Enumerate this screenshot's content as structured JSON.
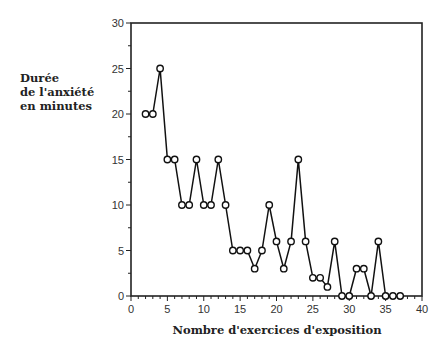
{
  "chart_data": {
    "type": "line",
    "title": "",
    "xlabel": "Nombre d'exercices d'exposition",
    "ylabel_lines": [
      "Durée",
      "de l'anxiété",
      "en minutes"
    ],
    "ylabel": "Durée de l'anxiété en minutes",
    "xlim": [
      0,
      40
    ],
    "ylim": [
      0,
      30
    ],
    "xticks": [
      0,
      5,
      10,
      15,
      20,
      25,
      30,
      35,
      40
    ],
    "yticks": [
      0,
      5,
      10,
      15,
      20,
      25,
      30
    ],
    "grid": false,
    "legend": null,
    "marker": "open-circle",
    "series": [
      {
        "name": "Durée de l'anxiété",
        "x": [
          2,
          3,
          4,
          5,
          6,
          7,
          8,
          9,
          10,
          11,
          12,
          13,
          14,
          15,
          16,
          17,
          18,
          19,
          20,
          21,
          22,
          23,
          24,
          25,
          26,
          27,
          28,
          29,
          30,
          31,
          32,
          33,
          34,
          35,
          36,
          37
        ],
        "values": [
          20,
          20,
          25,
          15,
          15,
          10,
          10,
          15,
          10,
          10,
          15,
          10,
          5,
          5,
          5,
          3,
          5,
          10,
          6,
          3,
          6,
          15,
          6,
          2,
          2,
          1,
          6,
          0,
          0,
          3,
          3,
          0,
          6,
          0,
          0,
          0
        ]
      }
    ]
  }
}
